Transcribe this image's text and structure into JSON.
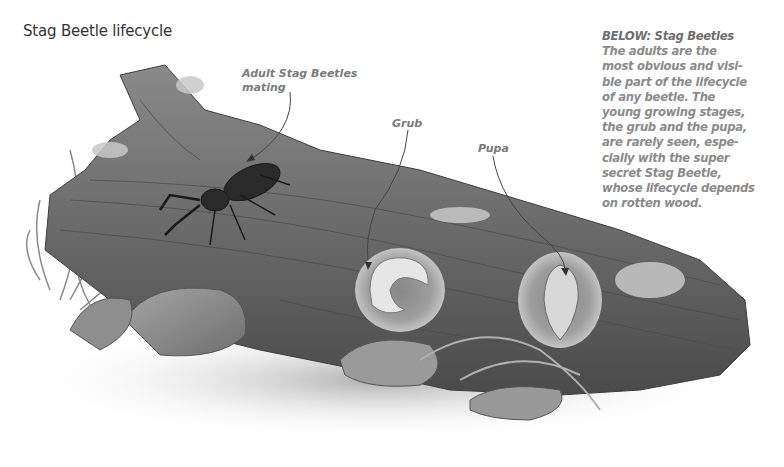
{
  "title": "Stag Beetle lifecycle",
  "caption": {
    "heading": "BELOW: Stag Beetles",
    "body": "The adults are the\nmost obvious and visi-\nble part of the lifecycle\nof any beetle. The\nyoung growing stages,\nthe grub and the pupa,\nare rarely seen, espe-\ncially with the super\nsecret Stag Beetle,\nwhose lifecycle depends\non rotten wood."
  },
  "labels": {
    "adult": "Adult Stag Beetles\nmating",
    "grub": "Grub",
    "pupa": "Pupa"
  },
  "illustration": {
    "subject": "rotten log with stag beetles, grub and pupa",
    "palette": [
      "#3a3a3a",
      "#6b6b6b",
      "#9a9a9a",
      "#cfcfcf"
    ]
  }
}
